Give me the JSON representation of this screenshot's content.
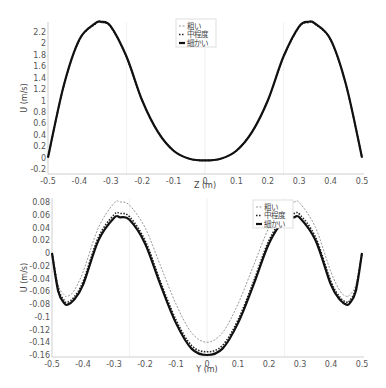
{
  "chart_data": [
    {
      "type": "line",
      "title": "",
      "xlabel": "Z (m)",
      "ylabel": "U (m/s)",
      "xlim": [
        -0.5,
        0.5
      ],
      "ylim": [
        -0.25,
        2.38
      ],
      "xticks": [
        "-0.5",
        "-0.4",
        "-0.3",
        "-0.2",
        "-0.1",
        "0",
        "0.1",
        "0.2",
        "0.3",
        "0.4",
        "0.5"
      ],
      "yticks": [
        "-0.2",
        "0",
        "0.2",
        "0.4",
        "0.6",
        "0.8",
        "1",
        "1.2",
        "1.4",
        "1.6",
        "1.8",
        "2",
        "2.2"
      ],
      "grid": true,
      "legend_position": "upper center",
      "x": [
        -0.5,
        -0.45,
        -0.4,
        -0.35,
        -0.33,
        -0.3,
        -0.25,
        -0.2,
        -0.15,
        -0.1,
        -0.05,
        0,
        0.05,
        0.1,
        0.15,
        0.2,
        0.25,
        0.3,
        0.33,
        0.35,
        0.4,
        0.45,
        0.5
      ],
      "series": [
        {
          "name": "粗い",
          "style": "dashed-gray",
          "values": [
            0.0,
            1.25,
            2.05,
            2.33,
            2.36,
            2.28,
            1.75,
            1.0,
            0.45,
            0.12,
            -0.02,
            -0.05,
            -0.02,
            0.12,
            0.45,
            1.0,
            1.75,
            2.28,
            2.36,
            2.33,
            2.05,
            1.25,
            0.0
          ]
        },
        {
          "name": "中程度",
          "style": "dotted-black",
          "values": [
            0.0,
            1.25,
            2.06,
            2.34,
            2.37,
            2.29,
            1.76,
            1.0,
            0.45,
            0.12,
            -0.02,
            -0.05,
            -0.02,
            0.12,
            0.45,
            1.0,
            1.76,
            2.29,
            2.37,
            2.34,
            2.06,
            1.25,
            0.0
          ]
        },
        {
          "name": "細かい",
          "style": "solid-black",
          "values": [
            0.0,
            1.26,
            2.07,
            2.35,
            2.38,
            2.3,
            1.77,
            1.0,
            0.45,
            0.12,
            -0.02,
            -0.05,
            -0.02,
            0.12,
            0.45,
            1.0,
            1.77,
            2.3,
            2.38,
            2.35,
            2.07,
            1.26,
            0.0
          ]
        }
      ]
    },
    {
      "type": "line",
      "title": "",
      "xlabel": "Y (m)",
      "ylabel": "U (m/s)",
      "xlim": [
        -0.5,
        0.5
      ],
      "ylim": [
        -0.16,
        0.08
      ],
      "xticks": [
        "-0.5",
        "-0.4",
        "-0.3",
        "-0.2",
        "-0.1",
        "0",
        "0.1",
        "0.2",
        "0.3",
        "0.4",
        "0.5"
      ],
      "yticks": [
        "0.08",
        "0.06",
        "0.04",
        "0.02",
        "0",
        "-0.02",
        "-0.04",
        "-0.06",
        "-0.08",
        "-0.1",
        "-0.12",
        "-0.14",
        "-0.16"
      ],
      "grid": true,
      "legend_position": "upper center",
      "x": [
        -0.5,
        -0.48,
        -0.46,
        -0.45,
        -0.43,
        -0.4,
        -0.35,
        -0.3,
        -0.28,
        -0.25,
        -0.2,
        -0.15,
        -0.1,
        -0.05,
        0,
        0.05,
        0.1,
        0.15,
        0.2,
        0.25,
        0.28,
        0.3,
        0.35,
        0.4,
        0.43,
        0.45,
        0.46,
        0.48,
        0.5
      ],
      "series": [
        {
          "name": "粗い",
          "style": "dashed-gray",
          "values": [
            0.0,
            -0.05,
            -0.066,
            -0.068,
            -0.06,
            -0.03,
            0.04,
            0.078,
            0.08,
            0.075,
            0.04,
            -0.02,
            -0.08,
            -0.125,
            -0.14,
            -0.125,
            -0.08,
            -0.02,
            0.04,
            0.075,
            0.08,
            0.078,
            0.04,
            -0.03,
            -0.06,
            -0.068,
            -0.066,
            -0.05,
            0.0
          ]
        },
        {
          "name": "中程度",
          "style": "dotted-black",
          "values": [
            0.0,
            -0.055,
            -0.075,
            -0.077,
            -0.07,
            -0.045,
            0.025,
            0.06,
            0.062,
            0.057,
            0.02,
            -0.045,
            -0.105,
            -0.145,
            -0.155,
            -0.145,
            -0.105,
            -0.045,
            0.02,
            0.057,
            0.062,
            0.06,
            0.025,
            -0.045,
            -0.07,
            -0.077,
            -0.075,
            -0.055,
            0.0
          ]
        },
        {
          "name": "細かい",
          "style": "solid-black",
          "values": [
            0.0,
            -0.06,
            -0.079,
            -0.081,
            -0.074,
            -0.05,
            0.02,
            0.055,
            0.056,
            0.052,
            0.015,
            -0.05,
            -0.11,
            -0.15,
            -0.16,
            -0.15,
            -0.11,
            -0.05,
            0.015,
            0.052,
            0.056,
            0.055,
            0.02,
            -0.05,
            -0.074,
            -0.081,
            -0.079,
            -0.06,
            0.0
          ]
        }
      ]
    }
  ]
}
